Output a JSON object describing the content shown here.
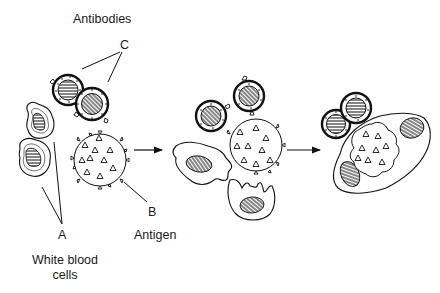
{
  "diagram": {
    "labels": {
      "antibodies": "Antibodies",
      "c": "C",
      "b": "B",
      "antigen": "Antigen",
      "a": "A",
      "white_blood_cells_line1": "White blood",
      "white_blood_cells_line2": "cells"
    },
    "stages": [
      {
        "name": "stage-1",
        "description": "Antibodies (C) near antigen (B); white blood cells (A) separate"
      },
      {
        "name": "stage-2",
        "description": "Antibodies bind antigen; white blood cells approach and engulf"
      },
      {
        "name": "stage-3",
        "description": "White blood cell engulfs antigen with antibodies attached"
      }
    ],
    "arrows": [
      {
        "from": "stage-1",
        "to": "stage-2"
      },
      {
        "from": "stage-2",
        "to": "stage-3"
      }
    ],
    "colors": {
      "stroke": "#111111",
      "background": "#ffffff"
    }
  }
}
